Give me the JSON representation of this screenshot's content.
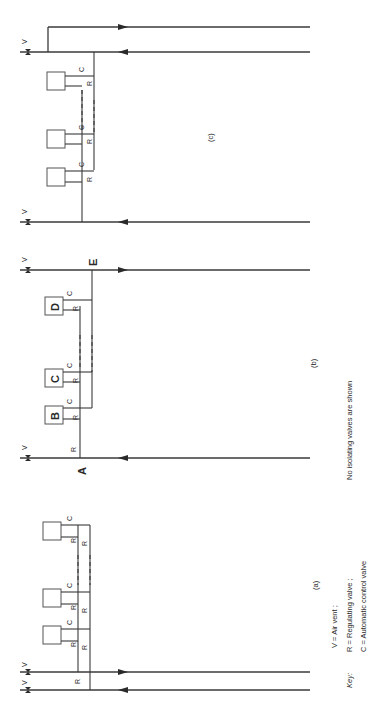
{
  "figure": {
    "orientation": "rotated 90 degrees counter-clockwise",
    "panels": [
      {
        "id": "c",
        "caption": "(c)"
      },
      {
        "id": "b",
        "caption": "(b)",
        "markers": [
          "A",
          "B",
          "C",
          "D",
          "E"
        ]
      },
      {
        "id": "a",
        "caption": "(a)"
      }
    ],
    "symbols": {
      "air_vent": "V",
      "regulating_valve": "R",
      "control_valve": "C"
    },
    "key": {
      "title": "Key:",
      "lines": [
        "V  =  Air vent ;",
        "R  =  Regulating valve ;",
        "C  =  Automatic control valve"
      ]
    },
    "note": "No isolating valves are shown"
  }
}
